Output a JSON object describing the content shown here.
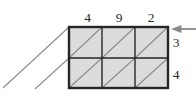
{
  "figure": {
    "top_digits": [
      "4",
      "9",
      "2"
    ],
    "right_digits": [
      "3",
      "4"
    ],
    "colors": {
      "background": "#ffffff",
      "cell_fill": "#dcdcdc",
      "grid_line": "#262626",
      "diagonal_line": "#8c8c8c",
      "arrow": "#8a8a8a",
      "digit_text": "#2b2b2b"
    }
  }
}
